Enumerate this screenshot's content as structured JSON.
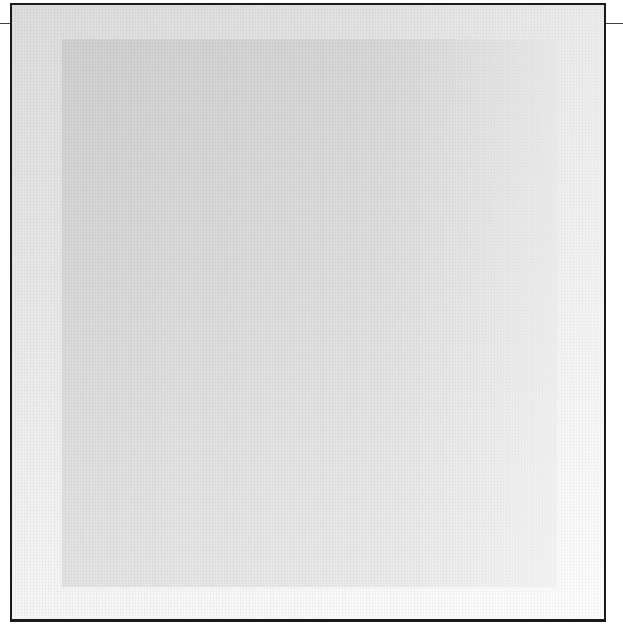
{
  "artwork": {
    "subject": "minimalist framed canvas",
    "colors": {
      "frame_border": "#1a1a1a",
      "outer_field": "#e6e6e6",
      "inner_square": "#dcdcdc",
      "background": "#ffffff"
    }
  }
}
